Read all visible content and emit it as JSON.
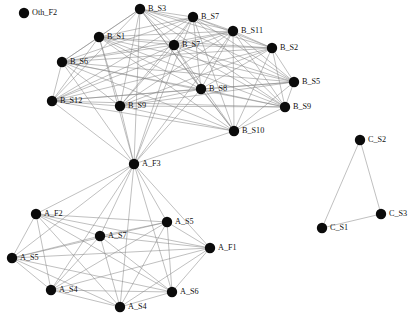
{
  "figure": {
    "title": "",
    "background_color": "#ffffff",
    "node_color": "#0b0b0b",
    "edge_color": "#808080",
    "label_color": "#111111",
    "node_radius": 5.2,
    "edge_width": 0.5,
    "width": 418,
    "height": 320
  },
  "chart_data": {
    "type": "network",
    "title": "",
    "xlabel": "",
    "ylabel": "",
    "grid": false,
    "legend": false,
    "directed": false,
    "node_count": 25,
    "edge_count": 193,
    "clusters": [
      {
        "name": "B",
        "label_prefix": "B_",
        "description": "dense upper cluster"
      },
      {
        "name": "A",
        "label_prefix": "A_",
        "description": "lower cluster with hub A_F3"
      },
      {
        "name": "C",
        "label_prefix": "C_",
        "description": "three-node triangle at right"
      },
      {
        "name": "Oth",
        "label_prefix": "Oth_",
        "description": "isolated node"
      }
    ],
    "nodes": [
      {
        "id": "Oth_F2",
        "label": "Oth_F2",
        "x": 24,
        "y": 13,
        "label_dx": 8,
        "label_dy": 0,
        "cluster": "Oth"
      },
      {
        "id": "B_S3",
        "label": "B_S3",
        "x": 140,
        "y": 9,
        "label_dx": 8,
        "label_dy": 0,
        "cluster": "B"
      },
      {
        "id": "B_S7a",
        "label": "B_S7",
        "x": 193,
        "y": 17,
        "label_dx": 8,
        "label_dy": 0,
        "cluster": "B"
      },
      {
        "id": "B_S11",
        "label": "B_S11",
        "x": 233,
        "y": 31,
        "label_dx": 8,
        "label_dy": 0,
        "cluster": "B"
      },
      {
        "id": "B_S1",
        "label": "B_S1",
        "x": 99,
        "y": 37,
        "label_dx": 8,
        "label_dy": 0,
        "cluster": "B"
      },
      {
        "id": "B_S7b",
        "label": "B_S7",
        "x": 174,
        "y": 45,
        "label_dx": 8,
        "label_dy": 0,
        "cluster": "B"
      },
      {
        "id": "B_S2",
        "label": "B_S2",
        "x": 272,
        "y": 48,
        "label_dx": 8,
        "label_dy": 0,
        "cluster": "B"
      },
      {
        "id": "B_S6",
        "label": "B_S6",
        "x": 62,
        "y": 62,
        "label_dx": 8,
        "label_dy": 0,
        "cluster": "B"
      },
      {
        "id": "B_S5",
        "label": "B_S5",
        "x": 294,
        "y": 82,
        "label_dx": 8,
        "label_dy": 0,
        "cluster": "B"
      },
      {
        "id": "B_S8",
        "label": "B_S8",
        "x": 201,
        "y": 89,
        "label_dx": 8,
        "label_dy": 0,
        "cluster": "B"
      },
      {
        "id": "B_S12",
        "label": "B_S12",
        "x": 52,
        "y": 101,
        "label_dx": 8,
        "label_dy": 0,
        "cluster": "B"
      },
      {
        "id": "B_S9a",
        "label": "B_S9",
        "x": 120,
        "y": 106,
        "label_dx": 8,
        "label_dy": 0,
        "cluster": "B"
      },
      {
        "id": "B_S9b",
        "label": "B_S9",
        "x": 285,
        "y": 107,
        "label_dx": 8,
        "label_dy": 0,
        "cluster": "B"
      },
      {
        "id": "B_S10",
        "label": "B_S10",
        "x": 234,
        "y": 131,
        "label_dx": 8,
        "label_dy": 0,
        "cluster": "B"
      },
      {
        "id": "A_F3",
        "label": "A_F3",
        "x": 134,
        "y": 164,
        "label_dx": 8,
        "label_dy": 0,
        "cluster": "A"
      },
      {
        "id": "C_S2",
        "label": "C_S2",
        "x": 360,
        "y": 140,
        "label_dx": 8,
        "label_dy": 0,
        "cluster": "C"
      },
      {
        "id": "C_S3",
        "label": "C_S3",
        "x": 381,
        "y": 214,
        "label_dx": 8,
        "label_dy": 0,
        "cluster": "C"
      },
      {
        "id": "C_S1",
        "label": "C_S1",
        "x": 322,
        "y": 228,
        "label_dx": 8,
        "label_dy": 0,
        "cluster": "C"
      },
      {
        "id": "A_F2",
        "label": "A_F2",
        "x": 36,
        "y": 214,
        "label_dx": 8,
        "label_dy": 0,
        "cluster": "A"
      },
      {
        "id": "A_S5a",
        "label": "A_S5",
        "x": 167,
        "y": 222,
        "label_dx": 8,
        "label_dy": 0,
        "cluster": "A"
      },
      {
        "id": "A_S7",
        "label": "A_S7",
        "x": 100,
        "y": 236,
        "label_dx": 8,
        "label_dy": 0,
        "cluster": "A"
      },
      {
        "id": "A_F1",
        "label": "A_F1",
        "x": 210,
        "y": 248,
        "label_dx": 8,
        "label_dy": 0,
        "cluster": "A"
      },
      {
        "id": "A_S5b",
        "label": "A_S5",
        "x": 12,
        "y": 258,
        "label_dx": 8,
        "label_dy": 0,
        "cluster": "A"
      },
      {
        "id": "A_S4a",
        "label": "A_S4",
        "x": 51,
        "y": 290,
        "label_dx": 8,
        "label_dy": 0,
        "cluster": "A"
      },
      {
        "id": "A_S6",
        "label": "A_S6",
        "x": 172,
        "y": 292,
        "label_dx": 8,
        "label_dy": 0,
        "cluster": "A"
      },
      {
        "id": "A_S4b",
        "label": "A_S4",
        "x": 120,
        "y": 307,
        "label_dx": 8,
        "label_dy": 0,
        "cluster": "A"
      }
    ],
    "edges": [
      [
        "B_S3",
        "B_S7a"
      ],
      [
        "B_S3",
        "B_S11"
      ],
      [
        "B_S3",
        "B_S1"
      ],
      [
        "B_S3",
        "B_S7b"
      ],
      [
        "B_S3",
        "B_S2"
      ],
      [
        "B_S3",
        "B_S6"
      ],
      [
        "B_S3",
        "B_S5"
      ],
      [
        "B_S3",
        "B_S8"
      ],
      [
        "B_S3",
        "B_S12"
      ],
      [
        "B_S3",
        "B_S9a"
      ],
      [
        "B_S3",
        "B_S9b"
      ],
      [
        "B_S3",
        "B_S10"
      ],
      [
        "B_S3",
        "A_F3"
      ],
      [
        "B_S7a",
        "B_S11"
      ],
      [
        "B_S7a",
        "B_S1"
      ],
      [
        "B_S7a",
        "B_S7b"
      ],
      [
        "B_S7a",
        "B_S2"
      ],
      [
        "B_S7a",
        "B_S6"
      ],
      [
        "B_S7a",
        "B_S5"
      ],
      [
        "B_S7a",
        "B_S8"
      ],
      [
        "B_S7a",
        "B_S12"
      ],
      [
        "B_S7a",
        "B_S9a"
      ],
      [
        "B_S7a",
        "B_S9b"
      ],
      [
        "B_S7a",
        "B_S10"
      ],
      [
        "B_S7a",
        "A_F3"
      ],
      [
        "B_S11",
        "B_S1"
      ],
      [
        "B_S11",
        "B_S7b"
      ],
      [
        "B_S11",
        "B_S2"
      ],
      [
        "B_S11",
        "B_S6"
      ],
      [
        "B_S11",
        "B_S5"
      ],
      [
        "B_S11",
        "B_S8"
      ],
      [
        "B_S11",
        "B_S12"
      ],
      [
        "B_S11",
        "B_S9a"
      ],
      [
        "B_S11",
        "B_S9b"
      ],
      [
        "B_S11",
        "B_S10"
      ],
      [
        "B_S11",
        "A_F3"
      ],
      [
        "B_S1",
        "B_S7b"
      ],
      [
        "B_S1",
        "B_S2"
      ],
      [
        "B_S1",
        "B_S6"
      ],
      [
        "B_S1",
        "B_S5"
      ],
      [
        "B_S1",
        "B_S8"
      ],
      [
        "B_S1",
        "B_S12"
      ],
      [
        "B_S1",
        "B_S9a"
      ],
      [
        "B_S1",
        "B_S9b"
      ],
      [
        "B_S1",
        "B_S10"
      ],
      [
        "B_S1",
        "A_F3"
      ],
      [
        "B_S7b",
        "B_S2"
      ],
      [
        "B_S7b",
        "B_S6"
      ],
      [
        "B_S7b",
        "B_S5"
      ],
      [
        "B_S7b",
        "B_S8"
      ],
      [
        "B_S7b",
        "B_S12"
      ],
      [
        "B_S7b",
        "B_S9a"
      ],
      [
        "B_S7b",
        "B_S9b"
      ],
      [
        "B_S7b",
        "B_S10"
      ],
      [
        "B_S7b",
        "A_F3"
      ],
      [
        "B_S2",
        "B_S6"
      ],
      [
        "B_S2",
        "B_S5"
      ],
      [
        "B_S2",
        "B_S8"
      ],
      [
        "B_S2",
        "B_S12"
      ],
      [
        "B_S2",
        "B_S9a"
      ],
      [
        "B_S2",
        "B_S9b"
      ],
      [
        "B_S2",
        "B_S10"
      ],
      [
        "B_S6",
        "B_S5"
      ],
      [
        "B_S6",
        "B_S8"
      ],
      [
        "B_S6",
        "B_S12"
      ],
      [
        "B_S6",
        "B_S9a"
      ],
      [
        "B_S6",
        "B_S9b"
      ],
      [
        "B_S6",
        "B_S10"
      ],
      [
        "B_S6",
        "A_F3"
      ],
      [
        "B_S5",
        "B_S8"
      ],
      [
        "B_S5",
        "B_S12"
      ],
      [
        "B_S5",
        "B_S9a"
      ],
      [
        "B_S5",
        "B_S9b"
      ],
      [
        "B_S5",
        "B_S10"
      ],
      [
        "B_S8",
        "B_S12"
      ],
      [
        "B_S8",
        "B_S9a"
      ],
      [
        "B_S8",
        "B_S9b"
      ],
      [
        "B_S8",
        "B_S10"
      ],
      [
        "B_S8",
        "A_F3"
      ],
      [
        "B_S12",
        "B_S9a"
      ],
      [
        "B_S12",
        "B_S9b"
      ],
      [
        "B_S12",
        "B_S10"
      ],
      [
        "B_S12",
        "A_F3"
      ],
      [
        "B_S9a",
        "B_S9b"
      ],
      [
        "B_S9a",
        "B_S10"
      ],
      [
        "B_S9a",
        "A_F3"
      ],
      [
        "B_S9b",
        "B_S10"
      ],
      [
        "B_S10",
        "A_F3"
      ],
      [
        "A_F3",
        "A_F2"
      ],
      [
        "A_F3",
        "A_S5a"
      ],
      [
        "A_F3",
        "A_S7"
      ],
      [
        "A_F3",
        "A_F1"
      ],
      [
        "A_F3",
        "A_S5b"
      ],
      [
        "A_F3",
        "A_S4a"
      ],
      [
        "A_F3",
        "A_S6"
      ],
      [
        "A_F3",
        "A_S4b"
      ],
      [
        "A_F2",
        "A_S5a"
      ],
      [
        "A_F2",
        "A_S7"
      ],
      [
        "A_F2",
        "A_F1"
      ],
      [
        "A_F2",
        "A_S5b"
      ],
      [
        "A_F2",
        "A_S4a"
      ],
      [
        "A_F2",
        "A_S6"
      ],
      [
        "A_F2",
        "A_S4b"
      ],
      [
        "A_S5a",
        "A_S7"
      ],
      [
        "A_S5a",
        "A_F1"
      ],
      [
        "A_S5a",
        "A_S5b"
      ],
      [
        "A_S5a",
        "A_S4a"
      ],
      [
        "A_S5a",
        "A_S6"
      ],
      [
        "A_S5a",
        "A_S4b"
      ],
      [
        "A_S7",
        "A_F1"
      ],
      [
        "A_S7",
        "A_S5b"
      ],
      [
        "A_S7",
        "A_S4a"
      ],
      [
        "A_S7",
        "A_S6"
      ],
      [
        "A_S7",
        "A_S4b"
      ],
      [
        "A_F1",
        "A_S5b"
      ],
      [
        "A_F1",
        "A_S4a"
      ],
      [
        "A_F1",
        "A_S6"
      ],
      [
        "A_F1",
        "A_S4b"
      ],
      [
        "A_S5b",
        "A_S4a"
      ],
      [
        "A_S5b",
        "A_S6"
      ],
      [
        "A_S5b",
        "A_S4b"
      ],
      [
        "A_S4a",
        "A_S6"
      ],
      [
        "A_S4a",
        "A_S4b"
      ],
      [
        "A_S6",
        "A_S4b"
      ],
      [
        "C_S1",
        "C_S2"
      ],
      [
        "C_S2",
        "C_S3"
      ],
      [
        "C_S1",
        "C_S3"
      ]
    ],
    "isolated_nodes": [
      "Oth_F2"
    ],
    "labels": [
      "Oth_F2",
      "B_S3",
      "B_S7",
      "B_S11",
      "B_S1",
      "B_S7",
      "B_S2",
      "B_S6",
      "B_S5",
      "B_S8",
      "B_S12",
      "B_S9",
      "B_S9",
      "B_S10",
      "A_F3",
      "C_S2",
      "C_S3",
      "C_S1",
      "A_F2",
      "A_S5",
      "A_S7",
      "A_F1",
      "A_S5",
      "A_S4",
      "A_S6",
      "A_S4"
    ]
  }
}
